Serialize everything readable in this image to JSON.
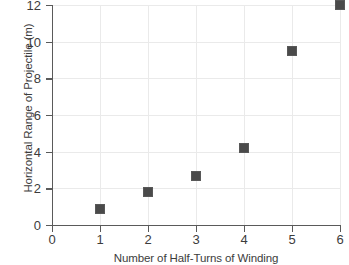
{
  "chart_data": {
    "type": "scatter",
    "title": "",
    "xlabel": "Number of Half-Turns of Winding",
    "ylabel": "Horizontal Range of Projectile (m)",
    "x": [
      1,
      2,
      3,
      4,
      5,
      6
    ],
    "values": [
      0.9,
      1.8,
      2.7,
      4.2,
      9.5,
      12.0
    ],
    "points": [
      {
        "x": 1,
        "y": 0.9
      },
      {
        "x": 2,
        "y": 1.8
      },
      {
        "x": 3,
        "y": 2.7
      },
      {
        "x": 4,
        "y": 4.2
      },
      {
        "x": 5,
        "y": 9.5
      },
      {
        "x": 6,
        "y": 12.0
      }
    ],
    "xlim": [
      0,
      6
    ],
    "ylim": [
      0,
      12
    ],
    "xticks": [
      "0",
      "1",
      "2",
      "3",
      "4",
      "5",
      "6"
    ],
    "yticks": [
      "0",
      "2",
      "4",
      "6",
      "8",
      "10",
      "12"
    ],
    "xtick_values": [
      0,
      1,
      2,
      3,
      4,
      5,
      6
    ],
    "ytick_values": [
      0,
      2,
      4,
      6,
      8,
      10,
      12
    ],
    "grid": true,
    "legend": "none",
    "marker": "square",
    "marker_color": "#4a4a4a",
    "grid_color": "#eaeaea",
    "axis_color": "#5a5a5a",
    "background": "#ffffff"
  }
}
